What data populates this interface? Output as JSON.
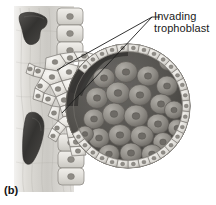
{
  "figure": {
    "panel_letter": "(b)",
    "background_color": "#ffffff",
    "ink_color": "#1a1a1a"
  },
  "annotation": {
    "name": "invading-trophoblast",
    "line1": "Invading",
    "line2": "trophoblast",
    "text_color": "#1a1a1a",
    "leader_color": "#1c1c1c",
    "leader_anchor": {
      "x": 152,
      "y": 17
    },
    "leader_targets": [
      {
        "x": 57,
        "y": 70
      },
      {
        "x": 62,
        "y": 113
      }
    ]
  },
  "illustration": {
    "type": "grayscale-medical-drawing",
    "endometrium": {
      "name": "endometrial-stroma",
      "fill_light": "#e8e7e4",
      "fill_mid": "#cfcdc8",
      "fill_dark": "#b4b1ab",
      "x": 14,
      "width": 58
    },
    "glands": [
      {
        "name": "upper-gland-lumen",
        "cx": 34,
        "cy": 29,
        "rx": 13,
        "ry": 14,
        "fill": "#3d3c3a"
      },
      {
        "name": "lower-gland-lumen",
        "cx": 32,
        "cy": 135,
        "rx": 10,
        "ry": 22,
        "fill": "#3a3937"
      }
    ],
    "epithelium": {
      "name": "uterine-epithelium-column",
      "cell_fill": "#e2e0db",
      "cell_stroke": "#8e8b85",
      "nucleus_fill": "#9b9892",
      "cell_count": 12
    },
    "blastocyst": {
      "name": "blastocyst-sphere",
      "cx": 128,
      "cy": 106,
      "r": 62,
      "trophoblast_ring": {
        "name": "trophoblast-cell-ring",
        "cell_fill": "#dcdad5",
        "cell_stroke": "#7e7b76",
        "nucleus_fill": "#8f8c86",
        "cell_count": 34
      },
      "cavity": {
        "name": "blastocoel-cavity",
        "fill": "#4a4845"
      },
      "inner_cell_mass": {
        "name": "inner-cell-mass",
        "cell_fill": "#9a9791",
        "cell_stroke": "#5b5954",
        "nucleus_fill": "#6e6b66",
        "cell_count": 26
      }
    },
    "invading_region": {
      "name": "invading-trophoblast-cells",
      "cell_fill": "#eceae5",
      "cell_stroke": "#7a7772",
      "nucleus_fill": "#8b8882",
      "cell_count": 30
    }
  }
}
